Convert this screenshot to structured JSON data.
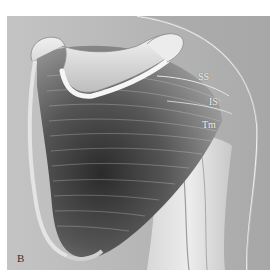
{
  "figure": {
    "panel_label": "B",
    "labels": {
      "ss": "SS",
      "is": "IS",
      "tm": "Tm"
    },
    "colors": {
      "background": "#b9b9b9",
      "bone": "#e2e2e2",
      "muscle_dark": "#3a3a3a",
      "muscle_mid": "#7a7a7a",
      "skin_outline": "#f0f0f0"
    }
  }
}
